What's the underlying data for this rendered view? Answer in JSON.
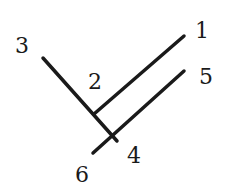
{
  "diagram": {
    "type": "line-diagram",
    "stroke_color": "#1a1a1a",
    "label_color": "#1a1a1a",
    "background": "#ffffff",
    "lines": [
      {
        "id": "line-3-4",
        "from_label": "3",
        "to_label": "4",
        "x1": 43,
        "y1": 58,
        "x2": 117,
        "y2": 141
      },
      {
        "id": "line-2-1",
        "from_label": "2",
        "to_label": "1",
        "x1": 94,
        "y1": 114,
        "x2": 184,
        "y2": 36
      },
      {
        "id": "line-6-5",
        "from_label": "6",
        "to_label": "5",
        "x1": 93,
        "y1": 153,
        "x2": 184,
        "y2": 71
      }
    ],
    "labels": [
      {
        "text": "1",
        "x": 202,
        "y": 31
      },
      {
        "text": "2",
        "x": 95,
        "y": 82
      },
      {
        "text": "3",
        "x": 22,
        "y": 46
      },
      {
        "text": "4",
        "x": 134,
        "y": 156
      },
      {
        "text": "5",
        "x": 206,
        "y": 77
      },
      {
        "text": "6",
        "x": 82,
        "y": 175
      }
    ]
  }
}
